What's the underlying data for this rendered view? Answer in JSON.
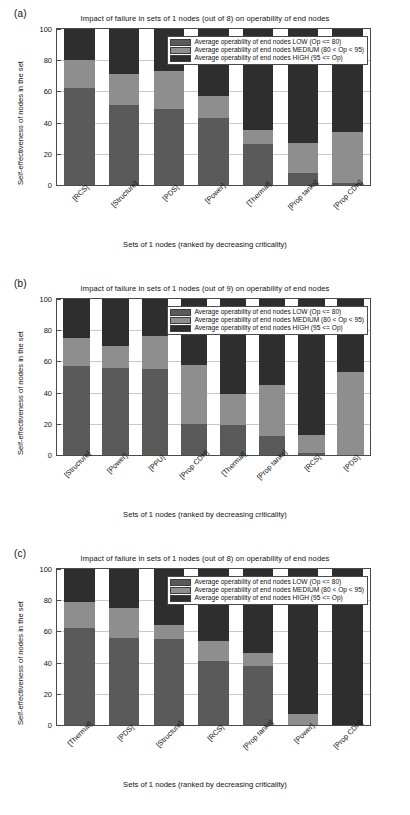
{
  "figure": {
    "panels": [
      "(a)",
      "(b)",
      "(c)"
    ],
    "legend": {
      "low": "Average operability of end nodes LOW (Op <= 80)",
      "medium": "Average operability of end nodes MEDIUM (80 < Op < 95)",
      "high": "Average operability of end nodes HIGH (95 <= Op)"
    },
    "colors": {
      "low": "#5a5a5a",
      "medium": "#8e8e8e",
      "high": "#2e2e2e",
      "grid": "#c9c9c9",
      "axis": "#4a4a4a"
    }
  },
  "chart_data": [
    {
      "type": "bar",
      "panel": "(a)",
      "title": "Impact of failure in sets of 1 nodes (out of 8) on operability of end nodes",
      "xlabel": "Sets of 1 nodes (ranked by decreasing criticality)",
      "ylabel": "Self-effectiveness of nodes in the set",
      "ylim": [
        0,
        100
      ],
      "yticks": [
        0,
        20,
        40,
        60,
        80,
        100
      ],
      "grid": true,
      "stacked": true,
      "legend_position": "top-right",
      "categories": [
        "[RCS]",
        "[Structure]",
        "[PDS]",
        "[Power]",
        "[Thermal]",
        "[Prop tanks]",
        "[Prop CDH]"
      ],
      "series": [
        {
          "name": "Average operability of end nodes LOW (Op <= 80)",
          "values": [
            62,
            51,
            49,
            43,
            26,
            8,
            1
          ]
        },
        {
          "name": "Average operability of end nodes MEDIUM (80 < Op < 95)",
          "values": [
            18,
            20,
            24,
            14,
            9,
            19,
            33
          ]
        },
        {
          "name": "Average operability of end nodes HIGH (95 <= Op)",
          "values": [
            20,
            29,
            27,
            43,
            65,
            73,
            66
          ]
        }
      ]
    },
    {
      "type": "bar",
      "panel": "(b)",
      "title": "Impact of failure in sets of 1 nodes (out of 9) on operability of end nodes",
      "xlabel": "Sets of 1 nodes (ranked by decreasing criticality)",
      "ylabel": "Self-effectiveness of nodes in the set",
      "ylim": [
        0,
        100
      ],
      "yticks": [
        0,
        20,
        40,
        60,
        80,
        100
      ],
      "grid": true,
      "stacked": true,
      "legend_position": "top-right",
      "categories": [
        "[Structure]",
        "[Power]",
        "[PPU]",
        "[Prop CDH]",
        "[Thermal]",
        "[Prop tanks]",
        "[RCS]",
        "[PDS]"
      ],
      "series": [
        {
          "name": "Average operability of end nodes LOW (Op <= 80)",
          "values": [
            57,
            56,
            55,
            20,
            19,
            12,
            1,
            0
          ]
        },
        {
          "name": "Average operability of end nodes MEDIUM (80 < Op < 95)",
          "values": [
            18,
            14,
            21,
            38,
            20,
            33,
            12,
            53
          ]
        },
        {
          "name": "Average operability of end nodes HIGH (95 <= Op)",
          "values": [
            25,
            30,
            24,
            42,
            61,
            55,
            87,
            47
          ]
        }
      ]
    },
    {
      "type": "bar",
      "panel": "(c)",
      "title": "Impact of failure in sets of 1 nodes (out of 8) on operability of end nodes",
      "xlabel": "Sets of 1 nodes (ranked by decreasing criticality)",
      "ylabel": "Self-effectiveness of nodes in the set",
      "ylim": [
        0,
        100
      ],
      "yticks": [
        0,
        20,
        40,
        60,
        80,
        100
      ],
      "grid": true,
      "stacked": true,
      "legend_position": "top-right",
      "categories": [
        "[Thermal]",
        "[PDS]",
        "[Structure]",
        "[RCS]",
        "[Prop tanks]",
        "[Power]",
        "[Prop CDH]"
      ],
      "series": [
        {
          "name": "Average operability of end nodes LOW (Op <= 80)",
          "values": [
            62,
            56,
            55,
            41,
            38,
            0,
            0
          ]
        },
        {
          "name": "Average operability of end nodes MEDIUM (80 < Op < 95)",
          "values": [
            17,
            19,
            9,
            13,
            8,
            7,
            0
          ]
        },
        {
          "name": "Average operability of end nodes HIGH (95 <= Op)",
          "values": [
            21,
            25,
            36,
            46,
            54,
            93,
            100
          ]
        }
      ]
    }
  ]
}
